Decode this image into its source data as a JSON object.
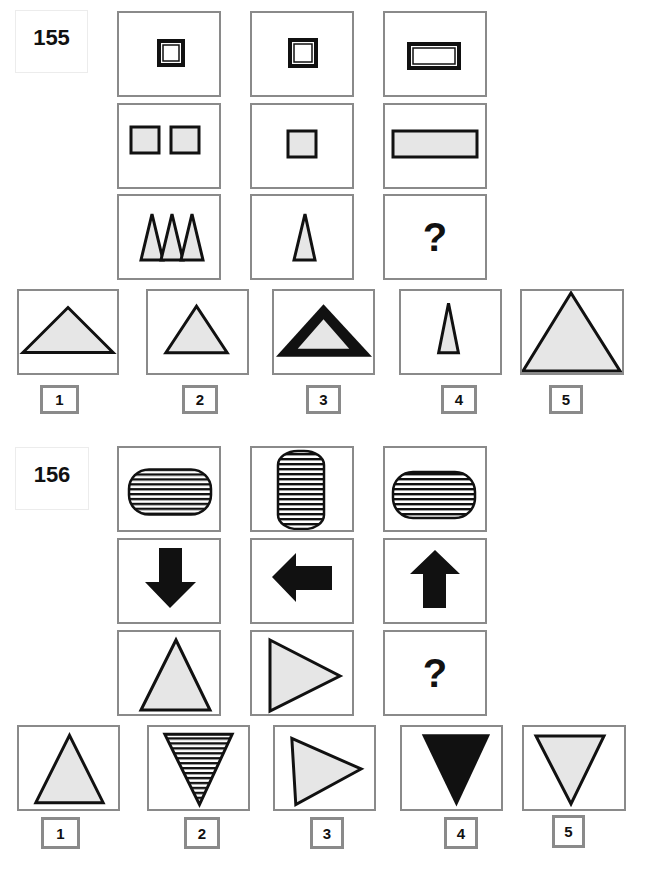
{
  "puzzles": [
    {
      "number": "155",
      "matrix": [
        [
          "double-outline-small-square",
          "double-outline-small-square",
          "double-outline-wide-rectangle"
        ],
        [
          "two-gray-squares",
          "one-gray-square",
          "one-wide-gray-rectangle"
        ],
        [
          "three-tall-gray-triangles",
          "one-tall-gray-triangle",
          "question-mark"
        ]
      ],
      "missing_symbol": "?",
      "options": [
        {
          "label": "1",
          "shape": "wide-flat-gray-triangle"
        },
        {
          "label": "2",
          "shape": "medium-gray-triangle"
        },
        {
          "label": "3",
          "shape": "thick-black-outlined-wide-triangle"
        },
        {
          "label": "4",
          "shape": "tall-narrow-gray-triangle"
        },
        {
          "label": "5",
          "shape": "large-gray-triangle"
        }
      ]
    },
    {
      "number": "156",
      "matrix": [
        [
          "horizontal-striped-capsule",
          "vertical-striped-capsule",
          "horizontal-striped-capsule"
        ],
        [
          "arrow-down",
          "arrow-left",
          "arrow-up"
        ],
        [
          "gray-triangle-up",
          "gray-triangle-right",
          "question-mark"
        ]
      ],
      "missing_symbol": "?",
      "options": [
        {
          "label": "1",
          "shape": "gray-triangle-up"
        },
        {
          "label": "2",
          "shape": "striped-triangle-down"
        },
        {
          "label": "3",
          "shape": "gray-triangle-right"
        },
        {
          "label": "4",
          "shape": "black-triangle-down"
        },
        {
          "label": "5",
          "shape": "gray-triangle-down"
        }
      ]
    }
  ],
  "colors": {
    "frame": "#8a8a8a",
    "shape_fill": "#e6e6e6",
    "shape_stroke": "#111111"
  }
}
